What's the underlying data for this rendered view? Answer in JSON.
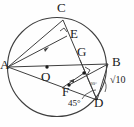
{
  "figure": {
    "type": "geometry-diagram",
    "stroke_color": "#3a3a3a",
    "label_color": "#1a1a1a",
    "background": "#ffffff"
  },
  "points": {
    "A": {
      "label": "A",
      "x": 8,
      "y": 67,
      "label_x": 1,
      "label_y": 60,
      "on_circle": true
    },
    "B": {
      "label": "B",
      "x": 108,
      "y": 64,
      "label_x": 112,
      "label_y": 57,
      "on_circle": true
    },
    "C": {
      "label": "C",
      "x": 63,
      "y": 20,
      "label_x": 57,
      "label_y": 2,
      "on_circle": true
    },
    "D": {
      "label": "D",
      "x": 95,
      "y": 99,
      "label_x": 95,
      "label_y": 97,
      "on_circle": true
    },
    "E": {
      "label": "E",
      "x": 67,
      "y": 36,
      "label_x": 70,
      "label_y": 28,
      "on_circle": false
    },
    "F": {
      "label": "F",
      "x": 69,
      "y": 85,
      "label_x": 64,
      "label_y": 86,
      "on_circle": false
    },
    "G": {
      "label": "G",
      "x": 84,
      "y": 73,
      "label_x": 78,
      "label_y": 47,
      "on_circle": false
    },
    "O": {
      "label": "O",
      "x": 47,
      "y": 67,
      "label_x": 42,
      "label_y": 71,
      "on_circle": false
    }
  },
  "segments": [
    {
      "name": "chord-A-C",
      "from": "A",
      "to": "C"
    },
    {
      "name": "chord-A-B",
      "from": "A",
      "to": "B"
    },
    {
      "name": "chord-C-D",
      "from": "C",
      "to": "D"
    },
    {
      "name": "chord-B-D",
      "from": "B",
      "to": "D"
    },
    {
      "name": "segment-A-E",
      "from": "A",
      "to": "E",
      "tick": "single-arrow"
    },
    {
      "name": "segment-A-D",
      "from": "A",
      "to": "D"
    },
    {
      "name": "segment-B-F",
      "from": "B",
      "to": "F"
    },
    {
      "name": "segment-G-F",
      "from": "G",
      "to": "F",
      "tick": "single-arrow"
    }
  ],
  "markers": {
    "right_angle_at_E": {
      "name": "right-angle-E",
      "present": true
    },
    "right_angle_at_G": {
      "name": "right-angle-G",
      "present": true
    },
    "arc_at_D": {
      "name": "angle-arc-D",
      "present": true
    },
    "center_dot_O": {
      "name": "center-dot",
      "present": true
    },
    "dot_F": {
      "name": "point-dot-F",
      "present": true
    },
    "dot_G": {
      "name": "point-dot-G",
      "present": true
    }
  },
  "annotations": {
    "side_length": {
      "label": "√10",
      "x": 113,
      "y": 80
    },
    "angle_45": {
      "label": "45°",
      "x": 72,
      "y": 100
    },
    "angle_small_D": {
      "label": "30°",
      "x": 92,
      "y": 84
    }
  },
  "circle": {
    "cx": 57,
    "cy": 67,
    "r": 50
  }
}
